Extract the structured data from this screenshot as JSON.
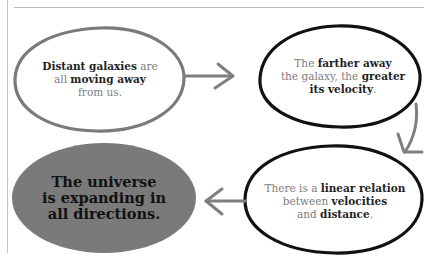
{
  "diagram": {
    "nodes": [
      {
        "id": "n1",
        "style": "outline-gray",
        "parts": [
          {
            "text": "Distant galaxies",
            "bold": true
          },
          {
            "text": " are",
            "bold": false
          },
          {
            "text": "all ",
            "bold": false,
            "newline": true
          },
          {
            "text": "moving away",
            "bold": true
          },
          {
            "text": "from us.",
            "bold": false,
            "newline": true
          }
        ],
        "l1a": "Distant galaxies",
        "l1b": " are",
        "l2a": "all ",
        "l2b": "moving away",
        "l3a": "from us."
      },
      {
        "id": "n2",
        "style": "outline-black",
        "l1a": "The ",
        "l1b": "farther away",
        "l2a": "the galaxy, the ",
        "l2b": "greater",
        "l3a": "its velocity",
        "l3b": "."
      },
      {
        "id": "n3",
        "style": "outline-black",
        "l1a": "There is a ",
        "l1b": "linear relation",
        "l2a": "between ",
        "l2b": "velocities",
        "l3a": "and ",
        "l3b": "distance",
        "l3c": "."
      },
      {
        "id": "n4",
        "style": "filled-gray",
        "l1": "The universe",
        "l2": "is expanding in",
        "l3": "all directions."
      }
    ],
    "edges": [
      {
        "from": "n1",
        "to": "n2",
        "direction": "right"
      },
      {
        "from": "n2",
        "to": "n3",
        "direction": "down"
      },
      {
        "from": "n3",
        "to": "n4",
        "direction": "left"
      }
    ],
    "colors": {
      "outline_gray": "#7a7a7a",
      "outline_black": "#111111",
      "fill_gray": "#7a7a7a",
      "arrow": "#7f7f7f",
      "frame": "#bdbdbd"
    }
  }
}
